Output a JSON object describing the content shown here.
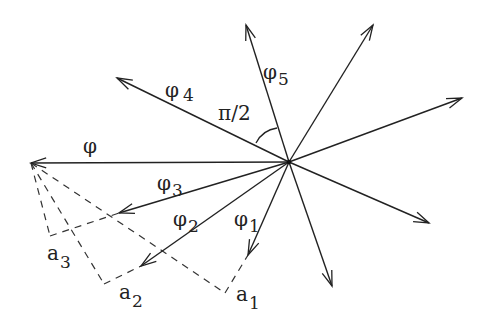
{
  "diagram": {
    "center": [
      289,
      162
    ],
    "vectors": [
      {
        "id": "phi",
        "tip": [
          31,
          163
        ],
        "label": "φ",
        "sub": ""
      },
      {
        "id": "phi4",
        "tip": [
          117,
          78
        ],
        "label": "φ",
        "sub": "4"
      },
      {
        "id": "phi5",
        "tip": [
          246,
          25
        ],
        "label": "φ",
        "sub": "5"
      },
      {
        "id": "v6",
        "tip": [
          373,
          25
        ],
        "label": "",
        "sub": ""
      },
      {
        "id": "v7",
        "tip": [
          462,
          98
        ],
        "label": "",
        "sub": ""
      },
      {
        "id": "v8",
        "tip": [
          429,
          223
        ],
        "label": "",
        "sub": ""
      },
      {
        "id": "v9",
        "tip": [
          332,
          286
        ],
        "label": "",
        "sub": ""
      },
      {
        "id": "phi1",
        "tip": [
          248,
          255
        ],
        "label": "φ",
        "sub": "1"
      },
      {
        "id": "phi2",
        "tip": [
          141,
          266
        ],
        "label": "φ",
        "sub": "2"
      },
      {
        "id": "phi3",
        "tip": [
          119,
          213
        ],
        "label": "φ",
        "sub": "3"
      }
    ],
    "projections": [
      {
        "id": "a1",
        "foot": [
          225,
          293
        ],
        "to": "phi1",
        "label": "a",
        "sub": "1"
      },
      {
        "id": "a2",
        "foot": [
          104,
          284
        ],
        "to": "phi2",
        "label": "a",
        "sub": "2"
      },
      {
        "id": "a3",
        "foot": [
          50,
          236
        ],
        "to": "phi3",
        "label": "a",
        "sub": "3"
      }
    ],
    "angle_label": "π/2",
    "labels": {
      "phi": {
        "text": "φ",
        "x": 83,
        "y": 153
      },
      "phi4": {
        "text": "φ",
        "sub": "4",
        "x": 165,
        "y": 97
      },
      "phi5": {
        "text": "φ",
        "sub": "5",
        "x": 263,
        "y": 79
      },
      "phi3": {
        "text": "φ",
        "sub": "3",
        "x": 157,
        "y": 190
      },
      "phi2": {
        "text": "φ",
        "sub": "2",
        "x": 173,
        "y": 226
      },
      "phi1": {
        "text": "φ",
        "sub": "1",
        "x": 234,
        "y": 226
      },
      "a3": {
        "text": "a",
        "sub": "3",
        "x": 47,
        "y": 260
      },
      "a2": {
        "text": "a",
        "sub": "2",
        "x": 119,
        "y": 299
      },
      "a1": {
        "text": "a",
        "sub": "1",
        "x": 236,
        "y": 301
      },
      "angle": {
        "text": "π/2",
        "x": 218,
        "y": 120
      }
    }
  }
}
